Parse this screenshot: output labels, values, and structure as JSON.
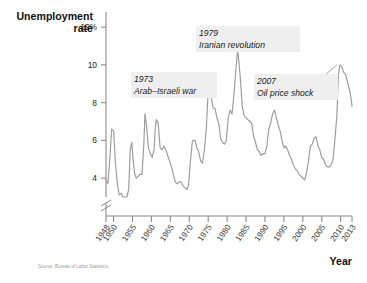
{
  "chart_data": {
    "type": "line",
    "title": "Unemployment rate",
    "xlabel": "Year",
    "ylabel": "Unemployment rate",
    "ylabel_line1": "Unemployment",
    "ylabel_line2": "rate",
    "source": "Source: Bureau of Labor Statistics.",
    "grid": false,
    "legend": "none",
    "xlim": [
      1948,
      2013
    ],
    "ylim": [
      3.0,
      12.8
    ],
    "y_axis_break": true,
    "y_tick_labels": [
      "12%",
      "10",
      "8",
      "6",
      "4"
    ],
    "y_ticks": [
      12,
      10,
      8,
      6,
      4
    ],
    "x_tick_labels": [
      "1948",
      "1950",
      "1955",
      "1960",
      "1965",
      "1970",
      "1975",
      "1980",
      "1985",
      "1990",
      "1995",
      "2000",
      "2005",
      "2010",
      "2013"
    ],
    "x_ticks": [
      1948,
      1950,
      1955,
      1960,
      1965,
      1970,
      1975,
      1980,
      1985,
      1990,
      1995,
      2000,
      2005,
      2010,
      2013
    ],
    "line_color": "#9a9a9a",
    "annotations": [
      {
        "year_label": "1973",
        "text": "Arab–Israeli war",
        "target_year": 1975,
        "target_value": 8.9
      },
      {
        "year_label": "1979",
        "text": "Iranian revolution",
        "target_year": 1982,
        "target_value": 10.8
      },
      {
        "year_label": "2007",
        "text": "Oil price shock",
        "target_year": 2009,
        "target_value": 10.0
      }
    ],
    "x": [
      1948.0,
      1948.5,
      1949.0,
      1949.5,
      1950.0,
      1950.5,
      1951.0,
      1951.5,
      1952.0,
      1952.5,
      1953.0,
      1953.5,
      1954.0,
      1954.4,
      1954.8,
      1955.2,
      1955.6,
      1956.0,
      1956.5,
      1957.0,
      1957.5,
      1958.0,
      1958.3,
      1958.7,
      1959.2,
      1959.7,
      1960.2,
      1960.7,
      1961.0,
      1961.3,
      1961.8,
      1962.3,
      1962.8,
      1963.3,
      1963.8,
      1964.3,
      1964.8,
      1965.3,
      1965.8,
      1966.3,
      1966.8,
      1967.3,
      1967.8,
      1968.3,
      1968.8,
      1969.3,
      1969.8,
      1970.3,
      1970.8,
      1971.0,
      1971.5,
      1972.0,
      1972.5,
      1973.0,
      1973.5,
      1974.0,
      1974.5,
      1975.0,
      1975.3,
      1975.8,
      1976.3,
      1976.8,
      1977.3,
      1977.8,
      1978.3,
      1978.8,
      1979.3,
      1979.8,
      1980.3,
      1980.8,
      1981.3,
      1981.8,
      1982.3,
      1982.8,
      1983.0,
      1983.5,
      1984.0,
      1984.5,
      1985.0,
      1985.5,
      1986.0,
      1986.5,
      1987.0,
      1987.5,
      1988.0,
      1988.5,
      1989.0,
      1989.5,
      1990.0,
      1990.5,
      1991.0,
      1991.5,
      1992.0,
      1992.5,
      1993.0,
      1993.5,
      1994.0,
      1994.5,
      1995.0,
      1995.5,
      1996.0,
      1996.5,
      1997.0,
      1997.5,
      1998.0,
      1998.5,
      1999.0,
      1999.5,
      2000.0,
      2000.5,
      2001.0,
      2001.5,
      2002.0,
      2002.5,
      2003.0,
      2003.5,
      2004.0,
      2004.5,
      2005.0,
      2005.5,
      2006.0,
      2006.5,
      2007.0,
      2007.5,
      2008.0,
      2008.5,
      2009.0,
      2009.4,
      2009.8,
      2010.3,
      2010.8,
      2011.3,
      2011.8,
      2012.3,
      2012.8,
      2013.0
    ],
    "y": [
      3.9,
      3.7,
      5.0,
      6.6,
      6.5,
      4.8,
      3.7,
      3.1,
      3.2,
      3.0,
      2.9,
      2.6,
      3.4,
      5.5,
      5.9,
      4.9,
      4.2,
      4.0,
      4.1,
      4.2,
      4.2,
      5.8,
      7.4,
      6.8,
      5.6,
      5.3,
      5.1,
      5.5,
      6.6,
      7.1,
      6.9,
      5.6,
      5.5,
      5.7,
      5.5,
      5.2,
      4.9,
      4.6,
      4.2,
      3.8,
      3.7,
      3.8,
      3.8,
      3.6,
      3.5,
      3.4,
      3.6,
      4.9,
      5.9,
      6.0,
      6.0,
      5.6,
      5.4,
      4.9,
      4.8,
      5.5,
      6.6,
      8.6,
      8.9,
      8.3,
      7.7,
      7.7,
      7.2,
      6.9,
      6.1,
      5.9,
      5.8,
      6.0,
      7.2,
      7.6,
      7.4,
      8.4,
      9.7,
      10.8,
      10.4,
      9.3,
      7.8,
      7.3,
      7.2,
      7.1,
      7.0,
      6.9,
      6.2,
      5.9,
      5.5,
      5.4,
      5.2,
      5.3,
      5.3,
      5.7,
      6.6,
      6.9,
      7.4,
      7.6,
      7.2,
      6.8,
      6.5,
      6.0,
      5.6,
      5.7,
      5.5,
      5.2,
      5.0,
      4.7,
      4.5,
      4.4,
      4.2,
      4.1,
      4.0,
      3.9,
      4.3,
      4.9,
      5.7,
      5.8,
      6.1,
      6.2,
      5.7,
      5.5,
      5.1,
      5.0,
      4.7,
      4.6,
      4.6,
      4.7,
      5.0,
      6.1,
      7.3,
      9.5,
      10.0,
      9.9,
      9.6,
      9.5,
      9.1,
      8.7,
      8.2,
      7.8,
      7.5
    ]
  }
}
